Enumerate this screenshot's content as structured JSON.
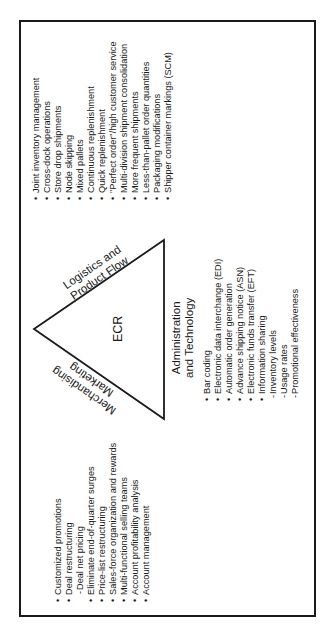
{
  "diagram": {
    "center_label": "ECR",
    "sides": {
      "logistics": "Logistics and",
      "logistics_2": "Product Flow",
      "merchandising": "Merchandising",
      "merchandising_2": "Marketing",
      "admin": "Administration",
      "admin_2": "and Technology"
    },
    "logistics_items": [
      {
        "bullet": "•",
        "text": "Joint inventory management"
      },
      {
        "bullet": "•",
        "text": "Cross-dock operations"
      },
      {
        "bullet": "•",
        "text": "Store drop shipments"
      },
      {
        "bullet": "•",
        "text": "Node skipping"
      },
      {
        "bullet": "•",
        "text": "Mixed pallets"
      },
      {
        "bullet": "•",
        "text": "Continuous replenishment"
      },
      {
        "bullet": "•",
        "text": "Quick replenishment"
      },
      {
        "bullet": "•",
        "text": "\"Perfect order\"/high customer service"
      },
      {
        "bullet": "•",
        "text": "Multi-division shipment consolidation"
      },
      {
        "bullet": "•",
        "text": "More frequent shipments"
      },
      {
        "bullet": "•",
        "text": "Less-than-pallet order quantities"
      },
      {
        "bullet": "•",
        "text": "Packaging modifications"
      },
      {
        "bullet": "•",
        "text": "Shipper container markings (SCM)"
      }
    ],
    "admin_items": [
      {
        "bullet": "•",
        "text": "Bar coding"
      },
      {
        "bullet": "•",
        "text": "Electronic data interchange (EDI)"
      },
      {
        "bullet": "•",
        "text": "Automatic order generation"
      },
      {
        "bullet": "•",
        "text": "Advance shipping notice (ASN)"
      },
      {
        "bullet": "•",
        "text": "Electronic funds transfer (EFT)"
      },
      {
        "bullet": "•",
        "text": "Information sharing"
      },
      {
        "bullet": "-",
        "text": "Inventory levels"
      },
      {
        "bullet": "-",
        "text": "Usage rates"
      },
      {
        "bullet": "-",
        "text": "Promotional effectiveness"
      }
    ],
    "merch_items": [
      {
        "bullet": "•",
        "text": "Customized promotions"
      },
      {
        "bullet": "•",
        "text": "Deal restructuring"
      },
      {
        "bullet": "-",
        "text": "Deal net pricing"
      },
      {
        "bullet": "•",
        "text": "Eliminate end-of-quarter surges"
      },
      {
        "bullet": "•",
        "text": "Price-list restructuring"
      },
      {
        "bullet": "•",
        "text": "Sales-force organization and rewards"
      },
      {
        "bullet": "•",
        "text": "Multi-functional selling teams"
      },
      {
        "bullet": "•",
        "text": "Account profitability analysis"
      },
      {
        "bullet": "•",
        "text": "Account management"
      }
    ]
  }
}
